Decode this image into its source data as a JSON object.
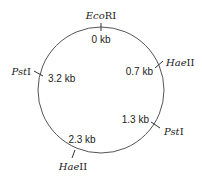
{
  "diagram": {
    "type": "plasmid-restriction-map",
    "top_caption_partial": "",
    "sites": [
      {
        "enzyme_italic": "Eco",
        "enzyme_roman": "RI",
        "position": "0 kb"
      },
      {
        "enzyme_italic": "Hae",
        "enzyme_roman": "II",
        "position": "0.7 kb"
      },
      {
        "enzyme_italic": "Pst",
        "enzyme_roman": "I",
        "position": "1.3 kb"
      },
      {
        "enzyme_italic": "Hae",
        "enzyme_roman": "II",
        "position": "2.3 kb"
      },
      {
        "enzyme_italic": "Pst",
        "enzyme_roman": "I",
        "position": "3.2 kb"
      }
    ]
  }
}
